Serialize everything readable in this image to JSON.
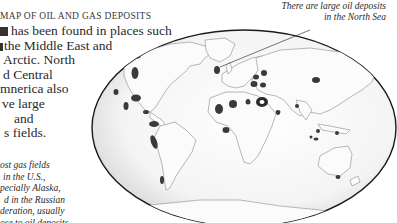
{
  "title": "MAP OF OIL AND GAS DEPOSITS",
  "intro_lines": [
    "Oil has been found in places such",
    "as the Middle East and",
    "the Arctic. North",
    "and Central",
    "America also",
    "have large",
    "oil and",
    "gas fields."
  ],
  "intro_visible_lines": [
    "has been found in places such",
    "the Middle East and",
    "Arctic. North",
    "Central",
    "nerica also",
    "ve large",
    "and",
    "fields."
  ],
  "note_visible_lines": [
    "ost gas fields",
    "in the U.S.,",
    "pecially Alaska,",
    "d in the Russian",
    "deration, usually",
    "ose to oil deposits."
  ],
  "callout": {
    "lines": [
      "There are large oil deposits",
      "in the North Sea"
    ]
  },
  "map": {
    "projection": "elliptical world map",
    "deposit_color": "#3a3a3a",
    "outline_color": "#1a1a1a",
    "land_stroke": "#9a9a9a"
  }
}
